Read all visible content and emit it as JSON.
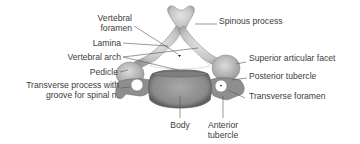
{
  "diagram": {
    "labels_left": [
      {
        "id": "vertebral-foramen",
        "lines": [
          "Vertebral",
          "foramen"
        ]
      },
      {
        "id": "lamina",
        "lines": [
          "Lamina"
        ]
      },
      {
        "id": "vertebral-arch",
        "lines": [
          "Vertebral arch"
        ]
      },
      {
        "id": "pedicle",
        "lines": [
          "Pedicle"
        ]
      },
      {
        "id": "transverse-process",
        "lines": [
          "Transverse process with",
          "groove for spinal n."
        ]
      }
    ],
    "labels_right": [
      {
        "id": "spinous-process",
        "lines": [
          "Spinous process"
        ]
      },
      {
        "id": "superior-articular-facet",
        "lines": [
          "Superior articular facet"
        ]
      },
      {
        "id": "posterior-tubercle",
        "lines": [
          "Posterior tubercle"
        ]
      },
      {
        "id": "transverse-foramen",
        "lines": [
          "Transverse foramen"
        ]
      }
    ],
    "labels_bottom": [
      {
        "id": "body",
        "lines": [
          "Body"
        ]
      },
      {
        "id": "anterior-tubercle",
        "lines": [
          "Anterior",
          "tubercle"
        ]
      }
    ],
    "colors": {
      "background": "#ffffff",
      "text": "#3c3c3c",
      "leader_line": "#555555",
      "bone_light": "#d6d6d6",
      "bone_mid": "#a9a9a9",
      "bone_dark": "#6e6e6e"
    }
  }
}
